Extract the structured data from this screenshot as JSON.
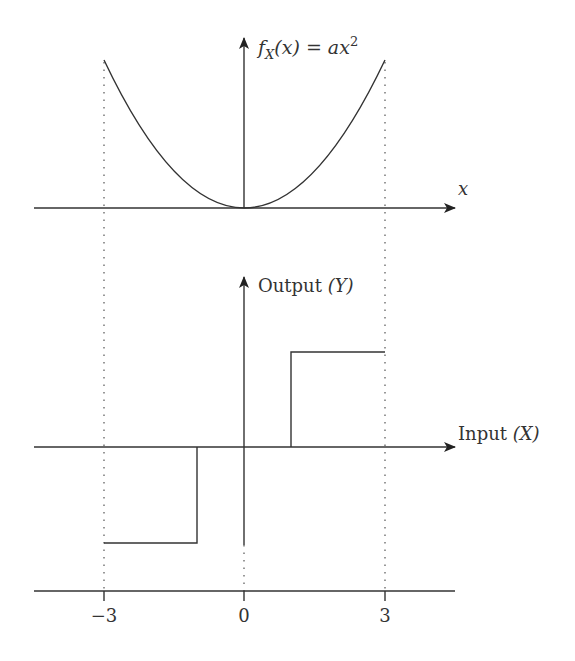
{
  "figure": {
    "top_panel": {
      "y_axis_label": {
        "prefix": "f",
        "subscript": "X",
        "mid": "(x) = ax",
        "superscript": "2"
      },
      "x_axis_label": "x",
      "curve": {
        "type": "parabola",
        "x_range": [
          -3,
          3
        ],
        "vertex": [
          0,
          0
        ]
      }
    },
    "bottom_panel": {
      "y_axis_label": {
        "text": "Output ",
        "var": "(Y)"
      },
      "x_axis_label": {
        "text": "Input ",
        "var": "(X)"
      },
      "step_function": {
        "segments": [
          {
            "x_from": -3,
            "x_to": -1,
            "level": "low"
          },
          {
            "x_from": -1,
            "x_to": 1,
            "level": "zero"
          },
          {
            "x_from": 1,
            "x_to": 3,
            "level": "high"
          }
        ]
      }
    },
    "ticks": [
      {
        "value": -3,
        "label": "−3"
      },
      {
        "value": 0,
        "label": "0"
      },
      {
        "value": 3,
        "label": "3"
      }
    ],
    "colors": {
      "line": "#333333",
      "dotted": "#555555",
      "background": "#ffffff"
    }
  }
}
